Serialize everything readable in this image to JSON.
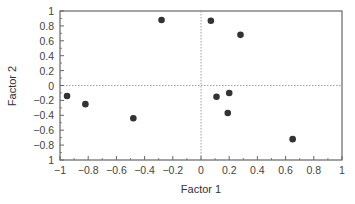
{
  "chart_data": {
    "type": "scatter",
    "title": "",
    "xlabel": "Factor 1",
    "ylabel": "Factor 2",
    "xlim": [
      -1,
      1
    ],
    "ylim": [
      -1,
      1
    ],
    "x_ticks": [
      -1,
      -0.8,
      -0.6,
      -0.4,
      -0.2,
      0,
      0.2,
      0.4,
      0.6,
      0.8,
      1
    ],
    "x_tick_labels": [
      "−1",
      "−0.8",
      "−0.6",
      "−0.4",
      "−0.2",
      "0",
      "0.2",
      "0.4",
      "0.6",
      "0.8",
      "1"
    ],
    "y_ticks": [
      1,
      0.8,
      0.6,
      0.4,
      0.2,
      0,
      -0.2,
      -0.4,
      -0.6,
      -0.8,
      -1
    ],
    "y_tick_labels": [
      "1",
      "0.8",
      "0.6",
      "0.4",
      "0.2",
      "0",
      "−0.2",
      "−0.4",
      "−0.6",
      "−0.8",
      "1"
    ],
    "grid": false,
    "reference_lines": {
      "x": 0,
      "y": 0,
      "style": "dotted"
    },
    "legend": null,
    "series": [
      {
        "name": "points",
        "color": "#333333",
        "x": [
          -0.95,
          -0.82,
          -0.48,
          -0.28,
          0.07,
          0.28,
          0.11,
          0.2,
          0.19,
          0.65
        ],
        "y": [
          -0.14,
          -0.25,
          -0.44,
          0.88,
          0.87,
          0.68,
          -0.15,
          -0.1,
          -0.37,
          -0.72
        ]
      }
    ]
  },
  "colors": {
    "axis": "#666666",
    "points": "#333333",
    "reference": "#888888"
  }
}
